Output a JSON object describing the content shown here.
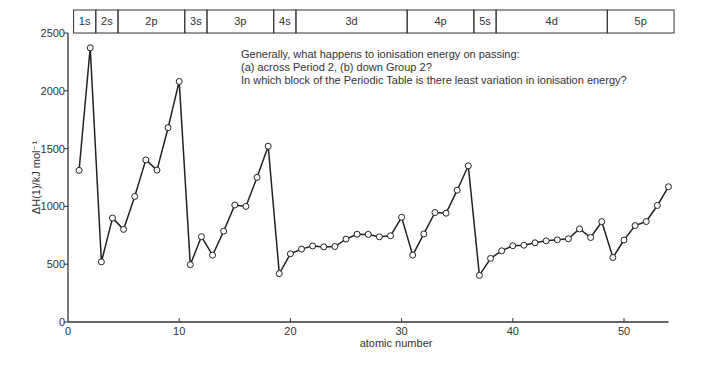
{
  "question": {
    "line1": "Generally, what happens to ionisation energy on passing:",
    "line2": "(a) across Period 2, (b) down Group 2?",
    "line3": "In which block of the Periodic Table is there least variation in ionisation energy?"
  },
  "chart_data": {
    "type": "line",
    "title": "",
    "xlabel": "atomic number",
    "ylabel": "ΔH(1)/kJ mol⁻¹",
    "xlim": [
      0,
      54
    ],
    "ylim": [
      0,
      2500
    ],
    "xticks": [
      0,
      10,
      20,
      30,
      40,
      50
    ],
    "yticks": [
      0,
      500,
      1000,
      1500,
      2000,
      2500
    ],
    "grid": false,
    "legend": null,
    "marker": "open-circle",
    "x": [
      1,
      2,
      3,
      4,
      5,
      6,
      7,
      8,
      9,
      10,
      11,
      12,
      13,
      14,
      15,
      16,
      17,
      18,
      19,
      20,
      21,
      22,
      23,
      24,
      25,
      26,
      27,
      28,
      29,
      30,
      31,
      32,
      33,
      34,
      35,
      36,
      37,
      38,
      39,
      40,
      41,
      42,
      43,
      44,
      45,
      46,
      47,
      48,
      49,
      50,
      51,
      52,
      53,
      54
    ],
    "series": [
      {
        "name": "first ionisation energy",
        "values": [
          1312,
          2372,
          520,
          899,
          801,
          1086,
          1402,
          1314,
          1681,
          2081,
          496,
          738,
          578,
          786,
          1012,
          1000,
          1251,
          1521,
          419,
          590,
          631,
          658,
          650,
          653,
          717,
          759,
          758,
          737,
          746,
          906,
          579,
          762,
          947,
          941,
          1140,
          1351,
          403,
          550,
          616,
          660,
          664,
          685,
          702,
          711,
          720,
          805,
          731,
          868,
          558,
          709,
          834,
          869,
          1008,
          1170
        ]
      }
    ],
    "blocks": [
      {
        "label": "1s",
        "from": 0.5,
        "to": 2.5
      },
      {
        "label": "2s",
        "from": 2.5,
        "to": 4.5
      },
      {
        "label": "2p",
        "from": 4.5,
        "to": 10.5
      },
      {
        "label": "3s",
        "from": 10.5,
        "to": 12.5
      },
      {
        "label": "3p",
        "from": 12.5,
        "to": 18.5
      },
      {
        "label": "4s",
        "from": 18.5,
        "to": 20.5
      },
      {
        "label": "3d",
        "from": 20.5,
        "to": 30.5
      },
      {
        "label": "4p",
        "from": 30.5,
        "to": 36.5
      },
      {
        "label": "5s",
        "from": 36.5,
        "to": 38.5
      },
      {
        "label": "4d",
        "from": 38.5,
        "to": 48.5
      },
      {
        "label": "5p",
        "from": 48.5,
        "to": 54.5
      }
    ]
  }
}
